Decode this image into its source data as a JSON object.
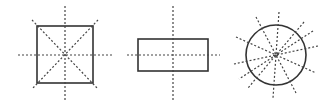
{
  "diagram": {
    "shapes": [
      {
        "name": "square",
        "symmetry_lines": 4
      },
      {
        "name": "rectangle",
        "symmetry_lines": 2
      },
      {
        "name": "circle",
        "symmetry_lines": "infinite (12 shown)"
      }
    ],
    "colors": {
      "shape_stroke": "#333333",
      "line_stroke": "#444444",
      "background": "#ffffff"
    }
  }
}
